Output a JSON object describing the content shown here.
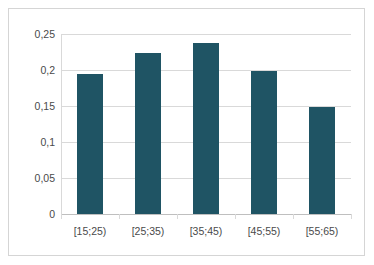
{
  "chart_data": {
    "type": "bar",
    "title": "",
    "xlabel": "",
    "ylabel": "",
    "categories": [
      "[15;25)",
      "[25;35)",
      "[35;45)",
      "[45;55)",
      "[55;65)"
    ],
    "values": [
      0.194,
      0.223,
      0.237,
      0.199,
      0.149
    ],
    "ylim": [
      0,
      0.25
    ],
    "ytick_labels": [
      "0,25",
      "0,2",
      "0,15",
      "0,1",
      "0,05",
      "0"
    ],
    "ytick_values": [
      0.25,
      0.2,
      0.15,
      0.1,
      0.05,
      0
    ],
    "grid": true,
    "legend": "none",
    "series_color": "#1f5464",
    "gridline_color": "#d9d9d9",
    "axis_text_color": "#4a4a4a",
    "border_color": "#d5d5d5",
    "decimal_separator": ","
  }
}
